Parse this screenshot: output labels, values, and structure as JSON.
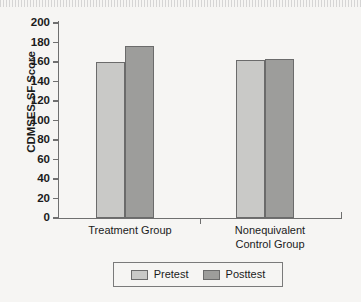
{
  "chart_data": {
    "type": "bar",
    "title": "",
    "subtitle": "",
    "xlabel": "",
    "ylabel": "CDMSES-SF Score",
    "categories": [
      "Treatment Group",
      "Nonequivalent\nControl Group"
    ],
    "series": [
      {
        "name": "Pretest",
        "color": "#c9c9c7",
        "values": [
          160,
          162
        ]
      },
      {
        "name": "Posttest",
        "color": "#9d9d9b",
        "values": [
          176,
          163
        ]
      }
    ],
    "ylim": [
      0,
      200
    ],
    "yticks": [
      0,
      20,
      40,
      60,
      80,
      100,
      120,
      140,
      160,
      180,
      200
    ],
    "ytick_labels": [
      "0",
      "20",
      "40",
      "60",
      "80",
      "100",
      "120",
      "140",
      "160",
      "180",
      "200"
    ],
    "grid": false,
    "legend_position": "bottom",
    "legend_entries": [
      "Pretest",
      "Posttest"
    ],
    "axis_color": "#6f6f6f",
    "background_color": "#f6f5f3"
  },
  "legend": {
    "pretest_label": "Pretest",
    "posttest_label": "Posttest"
  },
  "axes": {
    "y_title": "CDMSES-SF Score",
    "category_1": "Treatment Group",
    "category_2": "Nonequivalent\nControl Group"
  }
}
